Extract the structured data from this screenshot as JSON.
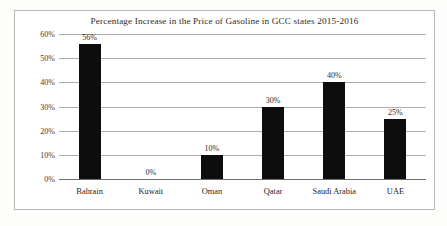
{
  "chart_data": {
    "type": "bar",
    "title": "Percentage Increase in the Price of Gasoline in GCC states 2015-2016",
    "categories": [
      "Bahrain",
      "Kuwait",
      "Oman",
      "Qatar",
      "Saudi Arabia",
      "UAE"
    ],
    "values": [
      56,
      0,
      10,
      30,
      40,
      25
    ],
    "data_labels": [
      "56%",
      "0%",
      "10%",
      "30%",
      "40%",
      "25%"
    ],
    "xlabel": "",
    "ylabel": "",
    "ylim": [
      0,
      60
    ],
    "ytick_labels": [
      "60%",
      "50%",
      "40%",
      "30%",
      "20%",
      "10%",
      "0%"
    ],
    "ytick_values": [
      60,
      50,
      40,
      30,
      20,
      10,
      0
    ],
    "grid": true,
    "legend": false,
    "bar_color": "#0d0d0d",
    "gridline_color": "#adadad",
    "frame_color": "#b9b9b9"
  }
}
